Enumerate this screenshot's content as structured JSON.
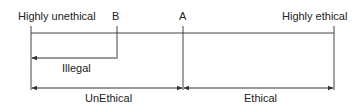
{
  "diagram": {
    "labels": {
      "highly_unethical": "Highly unethical",
      "point_b": "B",
      "point_a": "A",
      "highly_ethical": "Highly ethical",
      "illegal": "Illegal",
      "unethical": "UnEthical",
      "ethical": "Ethical"
    },
    "line_color": "#333333"
  }
}
